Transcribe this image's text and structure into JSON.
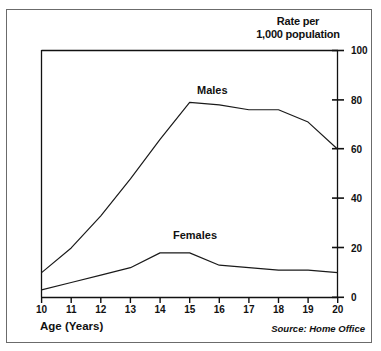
{
  "chart_data": {
    "type": "line",
    "title": "Rate per 1,000 population",
    "title_line1": "Rate per",
    "title_line2": "1,000 population",
    "xlabel": "Age (Years)",
    "ylabel": "Rate per 1,000 population",
    "source": "Source: Home Office",
    "x": [
      10,
      11,
      12,
      13,
      14,
      15,
      16,
      17,
      18,
      19,
      20
    ],
    "xlim": [
      10,
      20
    ],
    "ylim": [
      0,
      100
    ],
    "xticks": [
      "10",
      "11",
      "12",
      "13",
      "14",
      "15",
      "16",
      "17",
      "18",
      "19",
      "20"
    ],
    "yticks": [
      "0",
      "20",
      "40",
      "60",
      "80",
      "100"
    ],
    "grid": false,
    "legend": "inline-labels",
    "series": [
      {
        "name": "Males",
        "values": [
          10,
          20,
          33,
          48,
          64,
          79,
          78,
          76,
          76,
          71,
          60
        ],
        "color": "#1a1a1a"
      },
      {
        "name": "Females",
        "values": [
          3,
          6,
          9,
          12,
          18,
          18,
          13,
          12,
          11,
          11,
          10
        ],
        "color": "#1a1a1a"
      }
    ]
  },
  "figure": {
    "axis_color": "#111111",
    "frame_color": "#6b6b6b",
    "background": "#ffffff"
  }
}
